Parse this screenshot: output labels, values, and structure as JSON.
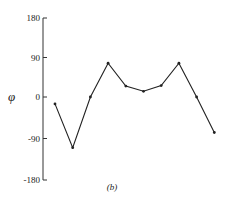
{
  "chart_data": {
    "type": "line",
    "title": "",
    "caption": "(b)",
    "xlabel": "",
    "ylabel": "φ",
    "ylim": [
      -180,
      180
    ],
    "yticks": [
      180,
      90,
      0,
      -90,
      -180
    ],
    "ytick_labels": [
      "180",
      "90",
      "0",
      "-90",
      "-180"
    ],
    "grid": false,
    "legend": null,
    "x": [
      1,
      2,
      3,
      4,
      5,
      6,
      7,
      8,
      9,
      10
    ],
    "series": [
      {
        "name": "φ",
        "values": [
          -15,
          -110,
          0,
          77,
          25,
          13,
          26,
          77,
          0,
          -77
        ],
        "color": "#222222",
        "marker": "dot"
      }
    ]
  },
  "colors": {
    "line": "#222222",
    "axis": "#333333",
    "text": "#222222"
  }
}
